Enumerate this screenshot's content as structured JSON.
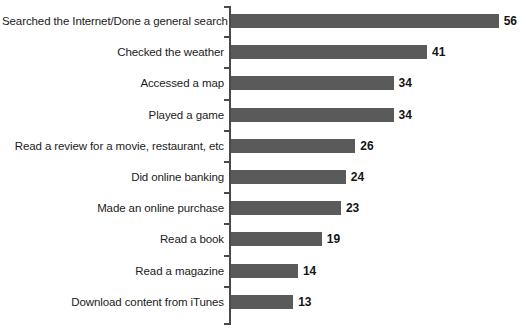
{
  "chart_data": {
    "type": "bar",
    "orientation": "horizontal",
    "title": "",
    "subtitle": "",
    "xlabel": "",
    "ylabel": "",
    "grid": false,
    "legend": null,
    "xlim": [
      0,
      60
    ],
    "axis_ticks_visible": true,
    "value_labels_shown": true,
    "bar_color": "#5a5a5a",
    "background_color": "#ffffff",
    "text_color": "#1c1c1c",
    "categories": [
      "Searched the Internet/Done a general search",
      "Checked the weather",
      "Accessed a map",
      "Played a game",
      "Read a review for a movie, restaurant, etc",
      "Did online banking",
      "Made an online purchase",
      "Read a book",
      "Read a magazine",
      "Download content from iTunes"
    ],
    "values": [
      56,
      41,
      34,
      34,
      26,
      24,
      23,
      19,
      14,
      13
    ],
    "bars": [
      {
        "label": "Searched the Internet/Done a general search",
        "value": 56,
        "value_label": "56"
      },
      {
        "label": "Checked the weather",
        "value": 41,
        "value_label": "41"
      },
      {
        "label": "Accessed a map",
        "value": 34,
        "value_label": "34"
      },
      {
        "label": "Played a game",
        "value": 34,
        "value_label": "34"
      },
      {
        "label": "Read a review for a movie, restaurant, etc",
        "value": 26,
        "value_label": "26"
      },
      {
        "label": "Did online banking",
        "value": 24,
        "value_label": "24"
      },
      {
        "label": "Made an online purchase",
        "value": 23,
        "value_label": "23"
      },
      {
        "label": "Read a book",
        "value": 19,
        "value_label": "19"
      },
      {
        "label": "Read a magazine",
        "value": 14,
        "value_label": "14"
      },
      {
        "label": "Download content from iTunes",
        "value": 13,
        "value_label": "13"
      }
    ]
  },
  "layout": {
    "axis_x": 229,
    "plot_left": 231,
    "row_top_first": 11,
    "row_pitch": 31.2,
    "px_per_unit": 4.78,
    "bar_height": 14
  }
}
